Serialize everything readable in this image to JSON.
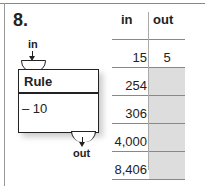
{
  "problem": {
    "number": "8.",
    "in_label": "in",
    "out_label": "out",
    "rule_box": {
      "title": "Rule",
      "operation": "– 10"
    }
  },
  "table": {
    "headers": {
      "in": "in",
      "out": "out"
    },
    "rows": [
      {
        "in": "15",
        "out": "5",
        "blank": false
      },
      {
        "in": "254",
        "out": "",
        "blank": true
      },
      {
        "in": "306",
        "out": "",
        "blank": true
      },
      {
        "in": "4,000",
        "out": "",
        "blank": true
      },
      {
        "in": "8,406",
        "out": "",
        "blank": true
      }
    ]
  },
  "colors": {
    "answer_cell": "#dddddd",
    "ink": "#222222"
  }
}
